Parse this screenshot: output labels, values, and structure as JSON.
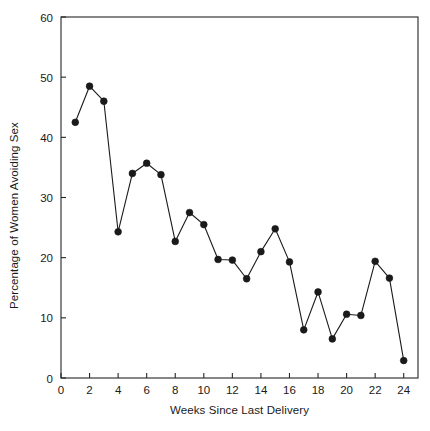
{
  "chart_data": {
    "type": "line",
    "title": "",
    "xlabel": "Weeks Since Last Delivery",
    "ylabel": "Percentage of Women Avoiding Sex",
    "xlim": [
      0,
      25
    ],
    "ylim": [
      0,
      60
    ],
    "xticks": [
      0,
      2,
      4,
      6,
      8,
      10,
      12,
      14,
      16,
      18,
      20,
      22,
      24
    ],
    "xticklabels": [
      "0",
      "2",
      "4",
      "6",
      "8",
      "10",
      "12",
      "14",
      "16",
      "18",
      "20",
      "22",
      "24"
    ],
    "yticks": [
      0,
      10,
      20,
      30,
      40,
      50,
      60
    ],
    "yticklabels": [
      "0",
      "10",
      "20",
      "30",
      "40",
      "50",
      "60"
    ],
    "grid": false,
    "legend": "none",
    "marker": "filled-circle",
    "line_color": "#1a1a1a",
    "marker_color": "#1a1a1a",
    "x": [
      1,
      2,
      3,
      4,
      5,
      6,
      7,
      8,
      9,
      10,
      11,
      12,
      13,
      14,
      15,
      16,
      17,
      18,
      19,
      20,
      21,
      22,
      23,
      24
    ],
    "values": [
      42.5,
      48.5,
      46.0,
      24.3,
      34.0,
      35.7,
      33.8,
      22.7,
      27.5,
      25.5,
      19.7,
      19.6,
      16.5,
      21.0,
      24.8,
      19.3,
      8.0,
      14.3,
      6.5,
      10.6,
      10.4,
      19.4,
      16.6,
      2.9
    ],
    "series": [
      {
        "name": "Percentage of Women Avoiding Sex",
        "values": [
          42.5,
          48.5,
          46.0,
          24.3,
          34.0,
          35.7,
          33.8,
          22.7,
          27.5,
          25.5,
          19.7,
          19.6,
          16.5,
          21.0,
          24.8,
          19.3,
          8.0,
          14.3,
          6.5,
          10.6,
          10.4,
          19.4,
          16.6,
          2.9
        ]
      }
    ]
  }
}
